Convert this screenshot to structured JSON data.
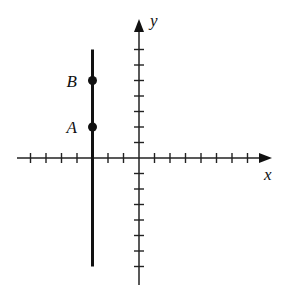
{
  "diagram": {
    "type": "coordinate-plane",
    "axes": {
      "x_label": "x",
      "y_label": "y",
      "x_ticks": [
        -7,
        -6,
        -5,
        -4,
        -3,
        -2,
        -1,
        1,
        2,
        3,
        4,
        5,
        6,
        7
      ],
      "y_ticks": [
        -7,
        -6,
        -5,
        -4,
        -3,
        -2,
        -1,
        1,
        2,
        3,
        4,
        5,
        6,
        7
      ]
    },
    "vertical_line": {
      "x": -3,
      "y_from": -7,
      "y_to": 7
    },
    "points": [
      {
        "label": "A",
        "x": -3,
        "y": 2
      },
      {
        "label": "B",
        "x": -3,
        "y": 5
      }
    ],
    "colors": {
      "ink": "#111111",
      "background": "#ffffff"
    }
  }
}
